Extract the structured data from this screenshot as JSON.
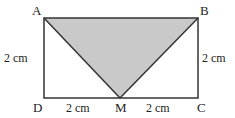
{
  "diagram": {
    "type": "geometry-rectangle-with-shaded-triangle",
    "colors": {
      "background": "#ffffff",
      "stroke": "#333333",
      "shade": "#c9c9c9",
      "text": "#222222"
    },
    "points": {
      "A": {
        "label": "A",
        "x": 44,
        "y": 18
      },
      "B": {
        "label": "B",
        "x": 198,
        "y": 18
      },
      "C": {
        "label": "C",
        "x": 198,
        "y": 98
      },
      "D": {
        "label": "D",
        "x": 44,
        "y": 98
      },
      "M": {
        "label": "M",
        "x": 120,
        "y": 98
      }
    },
    "shaded_region": "triangle ABM",
    "dimensions": {
      "AD": "2 cm",
      "BC": "2 cm",
      "DM": "2 cm",
      "MC": "2 cm"
    }
  }
}
